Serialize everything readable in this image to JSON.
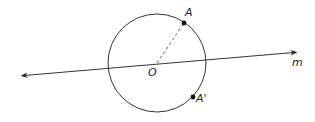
{
  "diagram": {
    "type": "geometry-reflection",
    "colors": {
      "stroke": "#333333",
      "point": "#111111",
      "label": "#222222",
      "background": "#ffffff"
    },
    "circle": {
      "center_label": "O",
      "cx": 157,
      "cy": 63,
      "r": 49
    },
    "line": {
      "label": "m",
      "x1": 18,
      "y1": 76,
      "x2": 300,
      "y2": 52,
      "arrows": "both"
    },
    "points": [
      {
        "label": "A",
        "x": 184,
        "y": 23
      },
      {
        "label": "A'",
        "x": 193,
        "y": 97
      }
    ],
    "segments": [
      {
        "from": "O",
        "to": "A",
        "style": "dashed"
      }
    ],
    "labels": {
      "center": "O",
      "point_a": "A",
      "point_a_prime": "A'",
      "line": "m"
    }
  }
}
